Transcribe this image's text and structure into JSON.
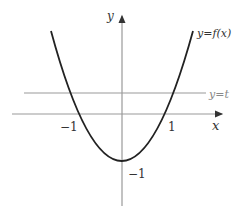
{
  "diagram": {
    "type": "function-graph",
    "axes": {
      "x_label": "x",
      "y_label": "y"
    },
    "curve_label": "y=f(x)",
    "line_label": "y=t",
    "ticks": {
      "x_neg": "−1",
      "x_pos": "1",
      "y_min": "−1"
    },
    "colors": {
      "curve": "#222222",
      "axis": "#999999",
      "line": "#999999"
    }
  }
}
